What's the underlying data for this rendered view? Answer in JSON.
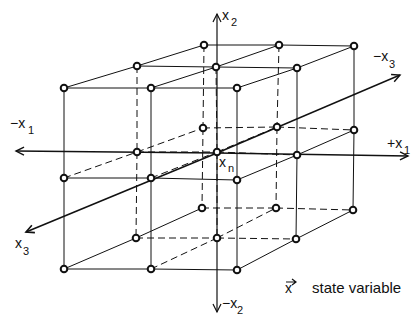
{
  "diagram": {
    "type": "3d-lattice-state-space",
    "axes": {
      "x1_pos": {
        "main": "+x",
        "sub": "1"
      },
      "x1_neg": {
        "main": "−x",
        "sub": "1"
      },
      "x2_pos": {
        "main": "x",
        "sub": "2"
      },
      "x2_neg": {
        "main": "−x",
        "sub": "2"
      },
      "x3_pos": {
        "main": "x",
        "sub": "3"
      },
      "x3_neg": {
        "main": "−x",
        "sub": "3"
      }
    },
    "center_node": {
      "main": "x",
      "sub": "n"
    },
    "legend": {
      "symbol": "x",
      "arrow": "→",
      "text": "state variable"
    },
    "lattice": {
      "layers": [
        "front",
        "middle",
        "back"
      ],
      "grid": "3x3x3",
      "node_count": 27
    },
    "colors": {
      "line": "#111111",
      "node_fill": "#ffffff",
      "background": "#ffffff"
    }
  }
}
